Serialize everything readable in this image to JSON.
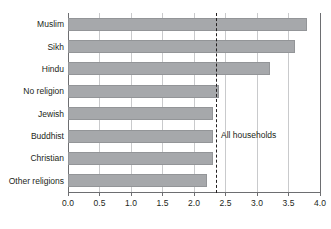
{
  "chart_data": {
    "type": "bar",
    "orientation": "horizontal",
    "title": "",
    "subtitle": "",
    "xlabel": "",
    "ylabel": "",
    "categories": [
      "Muslim",
      "Sikh",
      "Hindu",
      "No religion",
      "Jewish",
      "Buddhist",
      "Christian",
      "Other religions"
    ],
    "values": [
      3.8,
      3.6,
      3.2,
      2.4,
      2.3,
      2.3,
      2.3,
      2.2
    ],
    "xlim": [
      0.0,
      4.0
    ],
    "xticks": [
      0.0,
      0.5,
      1.0,
      1.5,
      2.0,
      2.5,
      3.0,
      3.5,
      4.0
    ],
    "xtick_labels": [
      "0.0",
      "0.5",
      "1.0",
      "1.5",
      "2.0",
      "2.5",
      "3.0",
      "3.5",
      "4.0"
    ],
    "grid": true,
    "grid_axis": "x",
    "legend": null,
    "bar_color": "#a6a8ab",
    "bar_edge_color": "#939598",
    "grid_color": "#c9cacc",
    "axis_color": "#6d6e71",
    "text_color": "#231f20",
    "annotations": [
      {
        "name": "all-households-reference",
        "label": "All households",
        "value": 2.35,
        "style": "dashed-vertical-line",
        "color": "#231f20"
      }
    ]
  }
}
